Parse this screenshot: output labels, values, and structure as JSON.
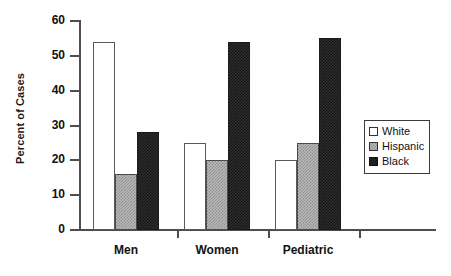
{
  "chart_data": {
    "type": "bar",
    "title": "",
    "xlabel": "",
    "ylabel": "Percent of Cases",
    "categories": [
      "Men",
      "Women",
      "Pediatric"
    ],
    "series": [
      {
        "name": "White",
        "values": [
          54,
          25,
          20
        ],
        "color": "#ffffff"
      },
      {
        "name": "Hispanic",
        "values": [
          16,
          20,
          25
        ],
        "color": "#b9b9b9"
      },
      {
        "name": "Black",
        "values": [
          28,
          54,
          55
        ],
        "color": "#2e2e2e"
      }
    ],
    "ylim": [
      0,
      60
    ],
    "yticks": [
      0,
      10,
      20,
      30,
      40,
      50,
      60
    ],
    "ytick_labels": [
      "0",
      "10",
      "20",
      "30",
      "40",
      "50",
      "60"
    ],
    "grid": false,
    "legend_position": "right"
  },
  "axis": {
    "y_title": "Percent of Cases",
    "ticks": [
      {
        "value": 60,
        "label": "60"
      },
      {
        "value": 50,
        "label": "50"
      },
      {
        "value": 40,
        "label": "40"
      },
      {
        "value": 30,
        "label": "30"
      },
      {
        "value": 20,
        "label": "20"
      },
      {
        "value": 10,
        "label": "10"
      },
      {
        "value": 0,
        "label": "0"
      }
    ]
  },
  "groups": [
    {
      "label": "Men",
      "bars": [
        54,
        16,
        28
      ]
    },
    {
      "label": "Women",
      "bars": [
        25,
        20,
        54
      ]
    },
    {
      "label": "Pediatric",
      "bars": [
        20,
        25,
        55
      ]
    }
  ],
  "legend": {
    "items": [
      {
        "label": "White",
        "key": "white"
      },
      {
        "label": "Hispanic",
        "key": "hispanic"
      },
      {
        "label": "Black",
        "key": "black"
      }
    ]
  }
}
